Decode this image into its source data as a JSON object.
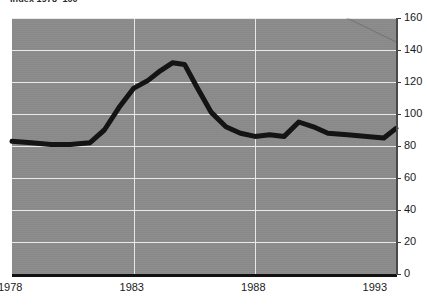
{
  "chart_data": {
    "type": "line",
    "title": "Index 1978=100",
    "xlabel": "",
    "ylabel": "",
    "xlim": [
      1978,
      1993.8
    ],
    "ylim": [
      0,
      160
    ],
    "ytick_step": 20,
    "grid": true,
    "legend": "none",
    "background_color": "#8b8b8b",
    "gridline_color": "#e8e8e8",
    "line_color": "#141414",
    "line_width_px": 5,
    "x_ticks": [
      "1978",
      "1983",
      "1988",
      "1993"
    ],
    "x_tick_values": [
      1978,
      1983,
      1988,
      1993
    ],
    "y_ticks": [
      "0",
      "20",
      "40",
      "60",
      "80",
      "100",
      "120",
      "140",
      "160"
    ],
    "y_tick_values": [
      0,
      20,
      40,
      60,
      80,
      100,
      120,
      140,
      160
    ],
    "series": [
      {
        "name": "Index",
        "x": [
          1978.0,
          1978.8,
          1979.6,
          1980.4,
          1981.2,
          1981.8,
          1982.4,
          1983.0,
          1983.6,
          1984.1,
          1984.6,
          1985.1,
          1985.6,
          1986.2,
          1986.8,
          1987.4,
          1988.0,
          1988.6,
          1989.2,
          1989.8,
          1990.4,
          1991.0,
          1991.8,
          1992.6,
          1993.3,
          1993.8
        ],
        "values": [
          83,
          82,
          81,
          81,
          82,
          90,
          104,
          116,
          121,
          127,
          132,
          131,
          117,
          101,
          92,
          88,
          86,
          87,
          86,
          95,
          92,
          88,
          87,
          86,
          85,
          91
        ],
        "color": "#141414"
      }
    ]
  }
}
